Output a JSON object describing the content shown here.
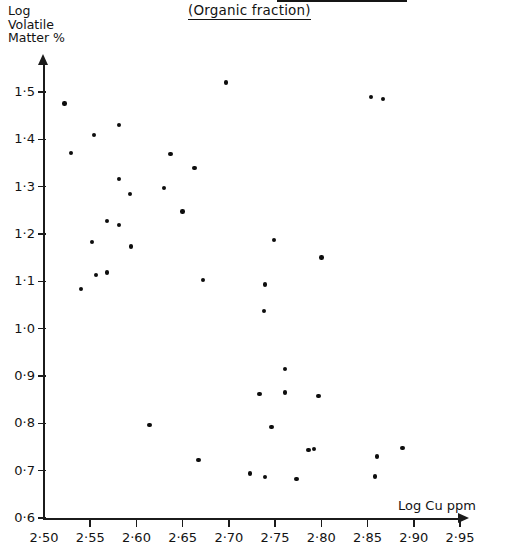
{
  "chart_data": {
    "type": "scatter",
    "title": "(Organic fraction)",
    "xlabel": "Log Cu ppm",
    "ylabel": "Log Volatile Matter %",
    "ylabel_lines": "Log\nVolatile\nMatter %",
    "xlim": [
      2.5,
      2.95
    ],
    "ylim": [
      0.6,
      1.55
    ],
    "grid": false,
    "legend": null,
    "decimal_separator": "·",
    "xticks": [
      2.5,
      2.55,
      2.6,
      2.65,
      2.7,
      2.75,
      2.8,
      2.85,
      2.9,
      2.95
    ],
    "xtick_labels": [
      "2·50",
      "2·55",
      "2·60",
      "2·65",
      "2·70",
      "2·75",
      "2·80",
      "2·85",
      "2·90",
      "2·95"
    ],
    "yticks": [
      0.6,
      0.7,
      0.8,
      0.9,
      1.0,
      1.1,
      1.2,
      1.3,
      1.4,
      1.5
    ],
    "ytick_labels": [
      "0·6",
      "0·7",
      "0·8",
      "0·9",
      "1·0",
      "1·1",
      "1·2",
      "1·3",
      "1·4",
      "1·5"
    ],
    "marker": "filled-circle",
    "marker_color": "#0d0d0d",
    "points": [
      {
        "x": 2.522,
        "y": 1.476
      },
      {
        "x": 2.581,
        "y": 1.431
      },
      {
        "x": 2.554,
        "y": 1.409
      },
      {
        "x": 2.529,
        "y": 1.371
      },
      {
        "x": 2.581,
        "y": 1.316
      },
      {
        "x": 2.593,
        "y": 1.284
      },
      {
        "x": 2.568,
        "y": 1.227
      },
      {
        "x": 2.581,
        "y": 1.219
      },
      {
        "x": 2.552,
        "y": 1.183
      },
      {
        "x": 2.594,
        "y": 1.174
      },
      {
        "x": 2.568,
        "y": 1.119
      },
      {
        "x": 2.556,
        "y": 1.113
      },
      {
        "x": 2.54,
        "y": 1.084
      },
      {
        "x": 2.637,
        "y": 1.369
      },
      {
        "x": 2.663,
        "y": 1.34
      },
      {
        "x": 2.63,
        "y": 1.297
      },
      {
        "x": 2.65,
        "y": 1.248
      },
      {
        "x": 2.749,
        "y": 1.187
      },
      {
        "x": 2.697,
        "y": 1.52
      },
      {
        "x": 2.854,
        "y": 1.489
      },
      {
        "x": 2.867,
        "y": 1.485
      },
      {
        "x": 2.672,
        "y": 1.103
      },
      {
        "x": 2.739,
        "y": 1.093
      },
      {
        "x": 2.738,
        "y": 1.038
      },
      {
        "x": 2.761,
        "y": 0.915
      },
      {
        "x": 2.733,
        "y": 0.862
      },
      {
        "x": 2.8,
        "y": 1.15
      },
      {
        "x": 2.761,
        "y": 0.865
      },
      {
        "x": 2.797,
        "y": 0.858
      },
      {
        "x": 2.746,
        "y": 0.792
      },
      {
        "x": 2.614,
        "y": 0.796
      },
      {
        "x": 2.786,
        "y": 0.744
      },
      {
        "x": 2.792,
        "y": 0.746
      },
      {
        "x": 2.86,
        "y": 0.73
      },
      {
        "x": 2.888,
        "y": 0.748
      },
      {
        "x": 2.667,
        "y": 0.722
      },
      {
        "x": 2.739,
        "y": 0.686
      },
      {
        "x": 2.773,
        "y": 0.682
      },
      {
        "x": 2.858,
        "y": 0.688
      },
      {
        "x": 2.723,
        "y": 0.694
      }
    ]
  },
  "geometry": {
    "x_pixel_at_min": 44,
    "x_pixel_per_unit": 924.4,
    "y_pixel_at_min": 518,
    "y_pixel_per_unit": 473.3
  }
}
